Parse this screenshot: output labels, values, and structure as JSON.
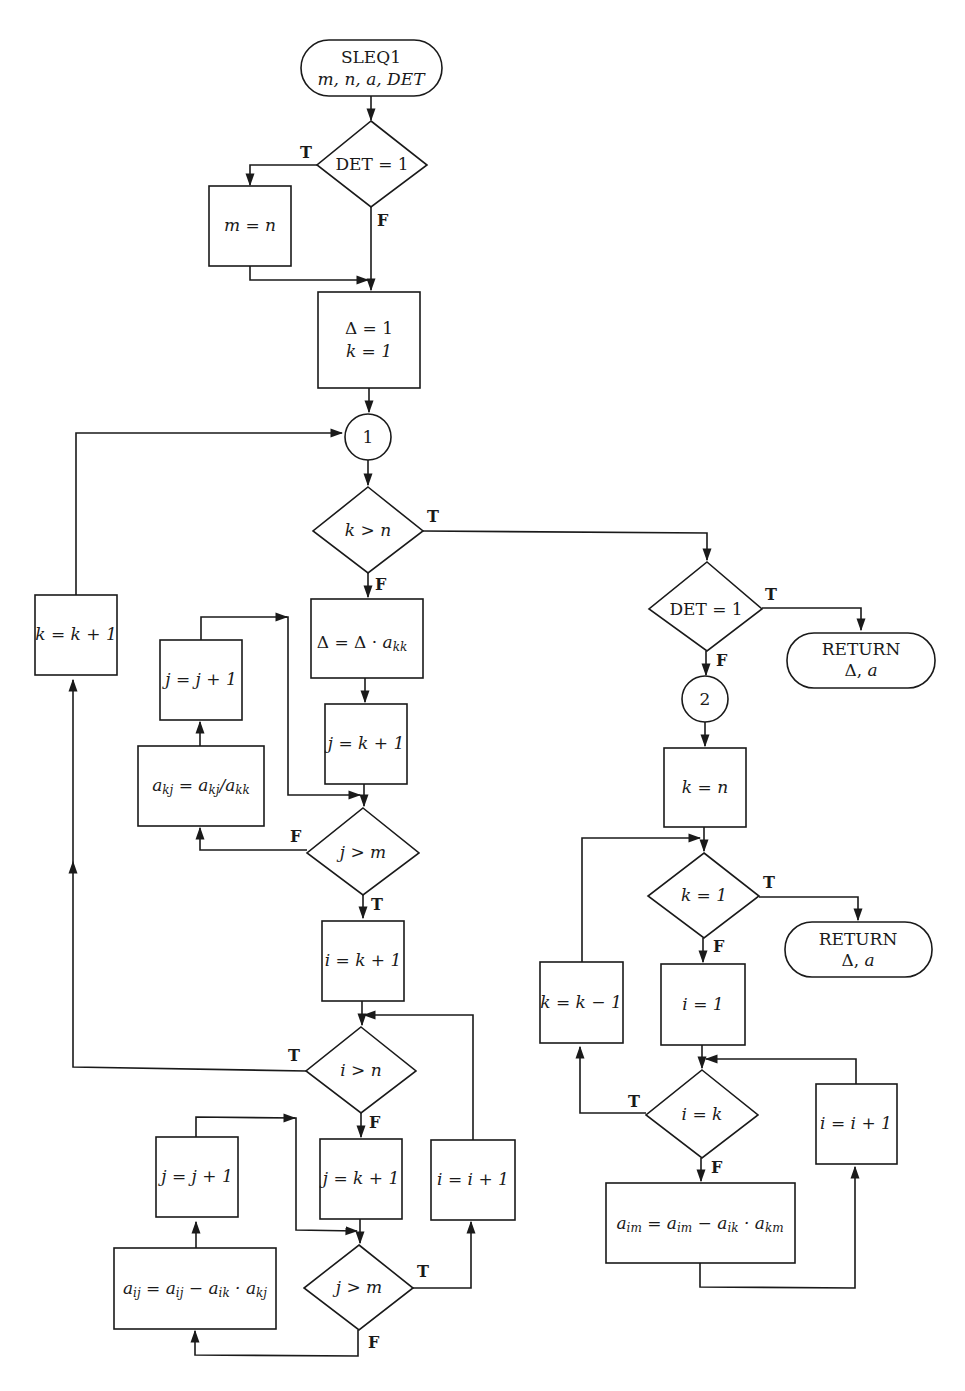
{
  "diagram": {
    "title": "SLEQ1",
    "start": {
      "line1": "SLEQ1",
      "line2": "m, n, a, DET"
    },
    "decisions": {
      "det1": "DET = 1",
      "k_gt_n": "k > n",
      "j_gt_m_1": "j > m",
      "i_gt_n": "i > n",
      "j_gt_m_2": "j > m",
      "det2": "DET  = 1",
      "k_eq_1": "k = 1",
      "i_eq_k": "i = k"
    },
    "processes": {
      "m_eq_n": "m = n",
      "init_delta": "Δ = 1",
      "init_k": "k = 1",
      "k_inc": "k = k + 1",
      "delta_mul": "Δ = Δ · a",
      "delta_mul_sub": "kk",
      "j_init_1": "j = k + 1",
      "j_inc_1": "j = j + 1",
      "akj_div": "a_kj = a_kj / a_kk",
      "i_init": "i = k + 1",
      "j_init_2": "j = k + 1",
      "i_inc_1": "i = i + 1",
      "j_inc_2": "j = j + 1",
      "aij_update": "a_ij = a_ij − a_ik · a_kj",
      "k_eq_n": "k = n",
      "k_dec": "k = k − 1",
      "i_eq_1": "i = 1",
      "i_inc_2": "i = i + 1",
      "aim_update": "a_im = a_im − a_ik · a_km"
    },
    "connectors": {
      "c1": "1",
      "c2": "2"
    },
    "terminals": {
      "return1": {
        "line1": "RETURN",
        "line2": "Δ, a"
      },
      "return2": {
        "line1": "RETURN",
        "line2": "Δ, a"
      }
    },
    "branch_labels": {
      "true": "T",
      "false": "F"
    }
  }
}
